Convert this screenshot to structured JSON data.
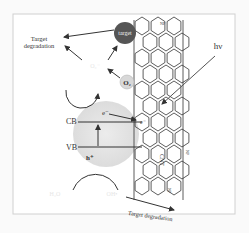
{
  "diagram": {
    "labels": {
      "target_degradation_top_line1": "Target",
      "target_degradation_top_line2": "degradation",
      "target_degradation_bottom": "Target degradation",
      "target": "target",
      "o2": "O₂",
      "o2_radical": "O₂⁻",
      "hv": "hν",
      "cb": "CB",
      "vb": "VB",
      "electron": "e⁻",
      "hole": "h⁺",
      "cnt": "CNT",
      "np_label": "NP",
      "h2o": "H₂O",
      "oh_radical": "OH•",
      "electron_cnt": "e⁻"
    },
    "colors": {
      "target_ball": "#555555",
      "o2_ball": "#d8d8d8",
      "semiconductor": "#e8e8e8",
      "line": "#333333"
    }
  }
}
